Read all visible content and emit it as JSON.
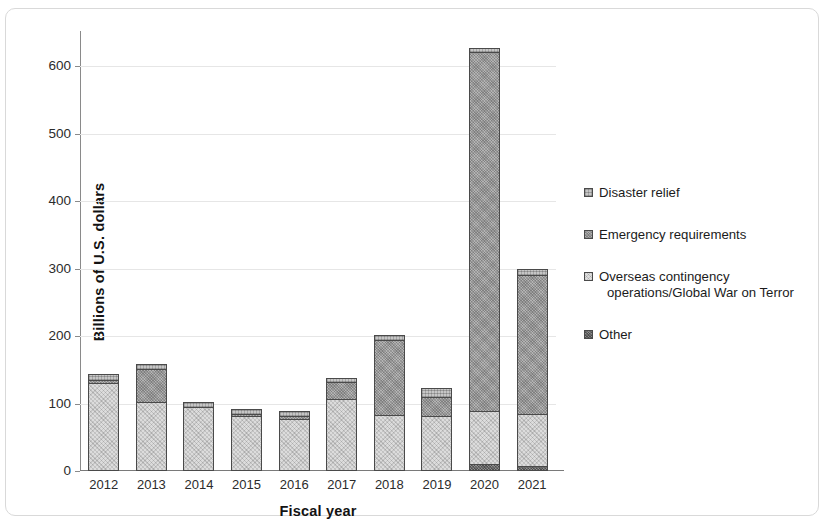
{
  "chart_data": {
    "type": "bar",
    "subtype": "stacked-bar",
    "title": "",
    "xlabel": "Fiscal year",
    "ylabel": "Billions of U.S. dollars",
    "categories": [
      "2012",
      "2013",
      "2014",
      "2015",
      "2016",
      "2017",
      "2018",
      "2019",
      "2020",
      "2021"
    ],
    "ylim": [
      0,
      640
    ],
    "yticks": [
      0,
      100,
      200,
      300,
      400,
      500,
      600
    ],
    "ytick_labels": [
      "0",
      "100",
      "200",
      "300",
      "400",
      "500",
      "600"
    ],
    "grid": true,
    "grid_axis": "y",
    "legend_position": "right",
    "stack_order_bottom_to_top": [
      "Other",
      "Overseas contingency operations/Global War on Terror",
      "Emergency requirements",
      "Disaster relief"
    ],
    "series": [
      {
        "name": "Other",
        "color": "#8f8f8f",
        "values": [
          0,
          0,
          0,
          0,
          0,
          0,
          0,
          0,
          7,
          5
        ]
      },
      {
        "name": "Overseas contingency operations/Global War on Terror",
        "color": "#dcdcdc",
        "values": [
          127,
          99,
          92,
          78,
          74,
          104,
          80,
          79,
          78,
          75
        ]
      },
      {
        "name": "Emergency requirements",
        "color": "#b4b4b4",
        "values": [
          3,
          48,
          0,
          2,
          3,
          23,
          110,
          26,
          530,
          205
        ]
      },
      {
        "name": "Disaster relief",
        "color": "#c6c6c6",
        "values": [
          8,
          5,
          6,
          6,
          6,
          5,
          6,
          12,
          5,
          7
        ]
      }
    ],
    "totals": [
      138,
      152,
      98,
      86,
      83,
      132,
      196,
      117,
      620,
      292
    ]
  },
  "axis": {
    "y_title": "Billions of U.S. dollars",
    "x_title": "Fiscal year"
  },
  "legend": {
    "items": [
      {
        "label": "Disaster relief",
        "label_line2": "",
        "swatch": "disaster"
      },
      {
        "label": "Emergency requirements",
        "label_line2": "",
        "swatch": "emergency"
      },
      {
        "label": "Overseas contingency",
        "label_line2": "operations/Global War on Terror",
        "swatch": "oco"
      },
      {
        "label": "Other",
        "label_line2": "",
        "swatch": "other"
      }
    ]
  }
}
